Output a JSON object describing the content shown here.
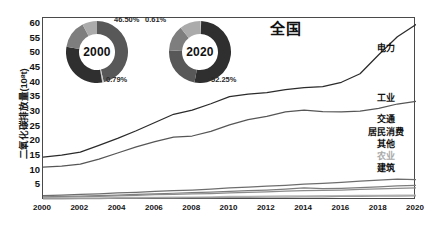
{
  "chart_data": {
    "type": "line",
    "title": "全国",
    "xlabel": "",
    "ylabel": "二氧化碳排放量(10⁸t)",
    "xlim": [
      2000,
      2020
    ],
    "ylim": [
      0,
      62
    ],
    "yticks": [
      60,
      55,
      50,
      45,
      40,
      35,
      30,
      25,
      20,
      15,
      10,
      5
    ],
    "xticks": [
      2000,
      2002,
      2004,
      2006,
      2008,
      2010,
      2012,
      2014,
      2016,
      2018,
      2020
    ],
    "grid": false,
    "legend_position": "right-inline-end-labels",
    "x": [
      2000,
      2001,
      2002,
      2003,
      2004,
      2005,
      2006,
      2007,
      2008,
      2009,
      2010,
      2011,
      2012,
      2013,
      2014,
      2015,
      2016,
      2017,
      2018,
      2019,
      2020
    ],
    "series": [
      {
        "name": "电力",
        "label": "电力",
        "color": "#2b2b2b",
        "values": [
          14.6,
          15.3,
          16.3,
          18.6,
          21.0,
          23.6,
          26.4,
          29.2,
          30.6,
          32.8,
          35.2,
          36.1,
          36.6,
          37.6,
          38.3,
          38.6,
          40.1,
          43.0,
          49.5,
          55.6,
          59.8
        ]
      },
      {
        "name": "工业",
        "label": "工业",
        "color": "#565656",
        "values": [
          11.2,
          11.5,
          12.2,
          13.9,
          16.0,
          18.1,
          19.9,
          21.4,
          21.8,
          23.4,
          25.6,
          27.4,
          28.5,
          30.0,
          30.6,
          30.1,
          30.0,
          30.3,
          31.2,
          32.7,
          33.6
        ]
      },
      {
        "name": "交通",
        "label": "交通",
        "color": "#6e6e6e",
        "values": [
          1.5,
          1.7,
          1.9,
          2.1,
          2.4,
          2.6,
          2.9,
          3.2,
          3.4,
          3.7,
          4.1,
          4.4,
          4.7,
          5.0,
          5.4,
          5.7,
          6.0,
          6.4,
          6.8,
          7.1,
          6.9
        ]
      },
      {
        "name": "居民消费",
        "label": "居民消费",
        "color": "#7d7d7d",
        "values": [
          1.1,
          1.2,
          1.3,
          1.5,
          1.7,
          1.9,
          2.1,
          2.3,
          2.5,
          2.7,
          2.9,
          3.2,
          3.4,
          3.7,
          4.1,
          3.9,
          4.0,
          4.2,
          4.5,
          4.8,
          5.0
        ]
      },
      {
        "name": "其他",
        "label": "其他",
        "color": "#8c8c8c",
        "values": [
          0.9,
          1.0,
          1.1,
          1.2,
          1.4,
          1.6,
          1.8,
          1.9,
          2.1,
          2.2,
          2.4,
          2.6,
          2.8,
          3.0,
          3.2,
          3.3,
          3.4,
          3.6,
          3.8,
          4.0,
          4.1
        ]
      },
      {
        "name": "农业",
        "label": "农业",
        "color": "#b8b8b8",
        "values": [
          0.6,
          0.6,
          0.7,
          0.7,
          0.8,
          0.9,
          0.9,
          1.0,
          1.0,
          1.1,
          1.2,
          1.2,
          1.3,
          1.4,
          1.4,
          1.5,
          1.5,
          1.6,
          1.6,
          1.7,
          1.7
        ]
      },
      {
        "name": "建筑",
        "label": "建筑",
        "color": "#9a9a9a",
        "values": [
          0.4,
          0.4,
          0.5,
          0.5,
          0.6,
          0.6,
          0.7,
          0.7,
          0.8,
          0.8,
          0.9,
          0.9,
          1.0,
          1.0,
          1.1,
          1.1,
          1.2,
          1.2,
          1.3,
          1.3,
          1.4
        ]
      }
    ],
    "insets": [
      {
        "name": "donut-2000",
        "year": "2000",
        "annotations": [
          {
            "text": "46.50%",
            "position": "top-right"
          },
          {
            "text": "0.79%",
            "position": "bottom-right"
          }
        ],
        "segments": [
          {
            "value": 46.5,
            "color": "#585858"
          },
          {
            "value": 0.79,
            "color": "#c9c9c9"
          },
          {
            "value": 30.4,
            "color": "#2f2f2f"
          },
          {
            "value": 14.6,
            "color": "#7e7e7e"
          },
          {
            "value": 7.71,
            "color": "#ababab"
          }
        ]
      },
      {
        "name": "donut-2020",
        "year": "2020",
        "annotations": [
          {
            "text": "0.61%",
            "position": "top-left"
          },
          {
            "text": "52.25%",
            "position": "bottom-right"
          }
        ],
        "segments": [
          {
            "value": 0.61,
            "color": "#c9c9c9"
          },
          {
            "value": 52.25,
            "color": "#2f2f2f"
          },
          {
            "value": 23.0,
            "color": "#585858"
          },
          {
            "value": 13.4,
            "color": "#7e7e7e"
          },
          {
            "value": 10.74,
            "color": "#ababab"
          }
        ]
      }
    ]
  }
}
